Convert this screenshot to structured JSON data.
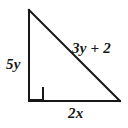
{
  "figure": {
    "kind": "right-triangle-diagram",
    "background_color": "#ffffff",
    "stroke_color": "#171717",
    "stroke_width": 2,
    "width": 128,
    "height": 128,
    "vertices": {
      "apex": {
        "x": 29,
        "y": 10
      },
      "right_angle": {
        "x": 29,
        "y": 101
      },
      "bottom_right": {
        "x": 120,
        "y": 101
      }
    },
    "right_angle_marker": {
      "present": true,
      "at_vertex": "right_angle",
      "size": 13
    },
    "labels": {
      "vertical_leg": "5y",
      "hypotenuse": "3y + 2",
      "horizontal_leg": "2x"
    }
  }
}
